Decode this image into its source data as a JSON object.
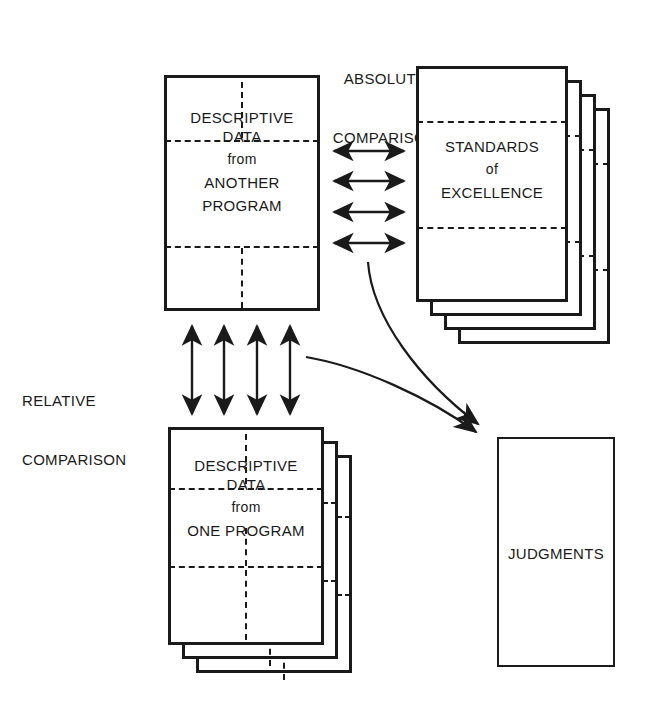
{
  "diagram": {
    "ink_color": "#1a1a1a",
    "background_color": "#ffffff",
    "labels": {
      "absolute_comparison_line1": "ABSOLUTE",
      "absolute_comparison_line2": "COMPARISON",
      "relative_comparison_line1": "RELATIVE",
      "relative_comparison_line2": "COMPARISON"
    },
    "boxes": {
      "another_program": {
        "name": "descriptive-data-another-program",
        "line1": "DESCRIPTIVE",
        "line2": "DATA",
        "line3": "from",
        "line4": "ANOTHER",
        "line5": "PROGRAM",
        "stack_count": 1
      },
      "standards": {
        "name": "standards-of-excellence",
        "line1": "STANDARDS",
        "line2": "of",
        "line3": "EXCELLENCE",
        "stack_count": 4
      },
      "one_program": {
        "name": "descriptive-data-one-program",
        "line1": "DESCRIPTIVE",
        "line2": "DATA",
        "line3": "from",
        "line4": "ONE PROGRAM",
        "stack_count": 3
      },
      "judgments": {
        "name": "judgments",
        "line1": "JUDGMENTS",
        "stack_count": 1
      }
    },
    "connectors": {
      "horizontal_double_arrows_count": "4",
      "vertical_double_arrows_count": "4",
      "curved_arrows_count": "2"
    }
  }
}
